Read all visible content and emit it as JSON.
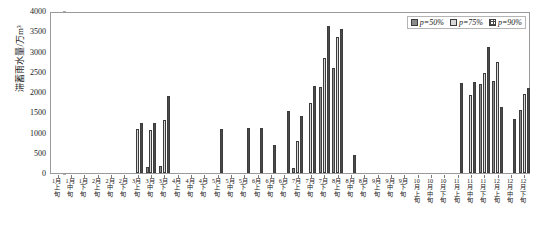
{
  "chart_data": {
    "type": "bar",
    "title": "",
    "xlabel": "",
    "ylabel": "滞蓄雨水量/万m³",
    "ylim": [
      0,
      4000
    ],
    "ytick_step": 500,
    "yticks": [
      0,
      500,
      1000,
      1500,
      2000,
      2500,
      3000,
      3500,
      4000
    ],
    "grid": false,
    "legend_position": "top-right",
    "categories": [
      "1月上旬",
      "1月中旬",
      "1月下旬",
      "2月上旬",
      "2月中旬",
      "2月下旬",
      "3月上旬",
      "3月中旬",
      "3月下旬",
      "4月上旬",
      "4月中旬",
      "4月下旬",
      "5月上旬",
      "5月中旬",
      "5月下旬",
      "6月上旬",
      "6月中旬",
      "6月下旬",
      "7月上旬",
      "7月中旬",
      "7月下旬",
      "8月上旬",
      "8月中旬",
      "8月下旬",
      "9月上旬",
      "9月中旬",
      "9月下旬",
      "10月上旬",
      "10月中旬",
      "10月下旬",
      "11月上旬",
      "11月中旬",
      "11月下旬",
      "12月上旬",
      "12月中旬",
      "12月下旬"
    ],
    "series": [
      {
        "name": "p=50%",
        "color": "#8a8a8a",
        "pattern": "solid",
        "values": [
          0,
          0,
          0,
          0,
          0,
          0,
          0,
          150,
          180,
          0,
          0,
          0,
          0,
          0,
          0,
          0,
          0,
          0,
          130,
          0,
          2120,
          2600,
          0,
          0,
          0,
          0,
          0,
          0,
          0,
          0,
          0,
          0,
          2200,
          2270,
          0,
          1550
        ]
      },
      {
        "name": "p=75%",
        "color": "#d8d8d8",
        "pattern": "light",
        "values": [
          0,
          0,
          0,
          0,
          0,
          0,
          1090,
          1060,
          1300,
          0,
          0,
          0,
          0,
          0,
          0,
          0,
          0,
          0,
          780,
          1730,
          2840,
          3350,
          0,
          0,
          0,
          0,
          0,
          0,
          0,
          0,
          0,
          1920,
          2480,
          2750,
          0,
          1940
        ]
      },
      {
        "name": "p=90%",
        "color": "#ffffff",
        "pattern": "dotted",
        "values": [
          0,
          0,
          0,
          0,
          0,
          0,
          1230,
          1240,
          1900,
          0,
          0,
          0,
          1080,
          0,
          1100,
          1110,
          680,
          1540,
          1400,
          2140,
          3630,
          3560,
          440,
          0,
          0,
          0,
          0,
          0,
          0,
          0,
          2230,
          2250,
          3100,
          1640,
          1340,
          2090
        ]
      }
    ]
  },
  "legend": {
    "items": [
      {
        "label": "p=50%"
      },
      {
        "label": "p=75%"
      },
      {
        "label": "p=90%"
      }
    ]
  }
}
